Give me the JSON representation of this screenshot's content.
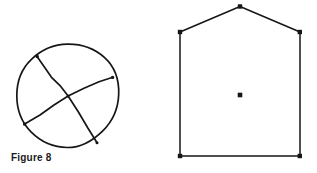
{
  "figure": {
    "caption": "Figure 8",
    "background_color": "#ffffff",
    "ink_color": "#161616",
    "canvas": {
      "width": 317,
      "height": 173
    }
  },
  "shapes": {
    "circle_with_chords": {
      "name": "circle-with-two-chords",
      "center": {
        "x": 67.5,
        "y": 95.5
      },
      "radius": 51,
      "stroke_width": 1.6,
      "chords": [
        {
          "name": "chord-upper-left-to-lower-right",
          "start": {
            "x": 37,
            "y": 56
          },
          "end": {
            "x": 97,
            "y": 143
          }
        },
        {
          "name": "chord-lower-left-to-upper-right",
          "start": {
            "x": 24,
            "y": 124
          },
          "end": {
            "x": 113,
            "y": 77
          }
        }
      ],
      "intersection": {
        "x": 68,
        "y": 96
      }
    },
    "pentagon_house": {
      "name": "house-pentagon",
      "stroke_width": 1.5,
      "vertices": [
        {
          "name": "apex",
          "x": 240,
          "y": 6
        },
        {
          "name": "right-shoulder",
          "x": 300,
          "y": 32
        },
        {
          "name": "bottom-right",
          "x": 300,
          "y": 156
        },
        {
          "name": "bottom-left",
          "x": 180,
          "y": 156
        },
        {
          "name": "left-shoulder",
          "x": 180,
          "y": 32
        }
      ],
      "vertex_marker": {
        "shape": "square",
        "size": 4
      },
      "center_point": {
        "name": "center-dot",
        "x": 240,
        "y": 95,
        "size": 4.5
      }
    }
  }
}
